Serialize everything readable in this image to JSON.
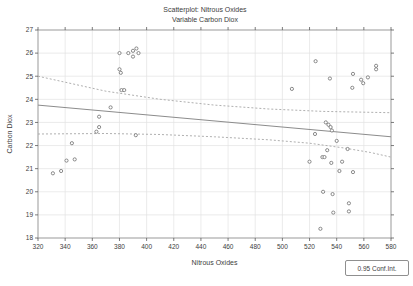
{
  "figure": {
    "title_line1": "Scatterplot: Nitrous Oxides",
    "title_line2": "Variable Carbon Diox",
    "xlabel": "Nitrous Oxides",
    "ylabel": "Carbon Diox",
    "legend_label": "0.95 Conf.Int."
  },
  "chart_data": {
    "type": "scatter",
    "title": "Scatterplot: Nitrous Oxides",
    "subtitle": "Variable Carbon Diox",
    "xlabel": "Nitrous Oxides",
    "ylabel": "Carbon Diox",
    "xlim": [
      320,
      580
    ],
    "ylim": [
      18,
      27
    ],
    "x_ticks": [
      320,
      340,
      360,
      380,
      400,
      420,
      440,
      460,
      480,
      500,
      520,
      540,
      560,
      580
    ],
    "y_ticks": [
      18,
      19,
      20,
      21,
      22,
      23,
      24,
      25,
      26,
      27
    ],
    "grid": true,
    "legend": {
      "label": "0.95 Conf.Int.",
      "position": "bottom-right"
    },
    "points": [
      [
        380,
        26.0
      ],
      [
        386.5,
        26.0
      ],
      [
        390,
        26.1
      ],
      [
        392.5,
        26.2
      ],
      [
        394,
        26.0
      ],
      [
        390,
        25.85
      ],
      [
        380,
        25.3
      ],
      [
        381,
        25.15
      ],
      [
        381.5,
        24.4
      ],
      [
        383.5,
        24.4
      ],
      [
        373.5,
        23.65
      ],
      [
        365,
        23.25
      ],
      [
        365,
        22.8
      ],
      [
        363,
        22.6
      ],
      [
        392,
        22.45
      ],
      [
        345,
        22.1
      ],
      [
        341,
        21.35
      ],
      [
        347,
        21.4
      ],
      [
        337,
        20.9
      ],
      [
        331,
        20.8
      ],
      [
        507,
        24.45
      ],
      [
        524.5,
        25.65
      ],
      [
        535,
        24.9
      ],
      [
        552,
        25.1
      ],
      [
        551.5,
        24.5
      ],
      [
        558,
        24.85
      ],
      [
        559.5,
        24.7
      ],
      [
        563,
        24.95
      ],
      [
        569,
        25.45
      ],
      [
        569,
        25.3
      ],
      [
        532,
        23.0
      ],
      [
        534,
        22.9
      ],
      [
        535.5,
        22.8
      ],
      [
        536.5,
        22.65
      ],
      [
        524,
        22.5
      ],
      [
        540,
        22.2
      ],
      [
        548,
        21.85
      ],
      [
        533,
        21.8
      ],
      [
        529.5,
        21.5
      ],
      [
        531,
        21.5
      ],
      [
        536,
        21.25
      ],
      [
        544,
        21.3
      ],
      [
        520,
        21.3
      ],
      [
        542,
        20.9
      ],
      [
        552,
        20.85
      ],
      [
        530,
        20.0
      ],
      [
        537,
        19.9
      ],
      [
        549,
        19.5
      ],
      [
        549,
        19.15
      ],
      [
        537.5,
        19.1
      ],
      [
        528,
        18.4
      ]
    ],
    "regression_line": [
      [
        320,
        23.75
      ],
      [
        580,
        22.38
      ]
    ],
    "ci_upper": [
      [
        320,
        25.0
      ],
      [
        370,
        24.35
      ],
      [
        410,
        24.0
      ],
      [
        450,
        23.75
      ],
      [
        490,
        23.58
      ],
      [
        530,
        23.48
      ],
      [
        580,
        23.42
      ]
    ],
    "ci_lower": [
      [
        320,
        22.5
      ],
      [
        370,
        22.52
      ],
      [
        410,
        22.48
      ],
      [
        450,
        22.38
      ],
      [
        490,
        22.25
      ],
      [
        520,
        22.1
      ],
      [
        545,
        21.9
      ],
      [
        565,
        21.7
      ],
      [
        580,
        21.5
      ]
    ],
    "colors": {
      "frame": "#8f8f8f",
      "axis": "#5a5a5a",
      "grid": "#e2e2e2",
      "marker": "#6f6f6f",
      "marker_fill": "#ffffff",
      "regression": "#8c8c8c",
      "ci": "#a6a6a6",
      "text": "#3d3d3d"
    }
  }
}
